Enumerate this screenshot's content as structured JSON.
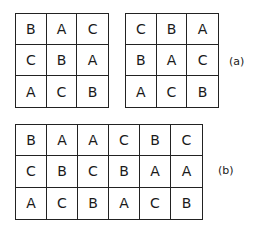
{
  "figure_a": {
    "label": "(a)",
    "left_square": [
      [
        "B",
        "A",
        "C"
      ],
      [
        "C",
        "B",
        "A"
      ],
      [
        "A",
        "C",
        "B"
      ]
    ],
    "right_square": [
      [
        "C",
        "B",
        "A"
      ],
      [
        "B",
        "A",
        "C"
      ],
      [
        "A",
        "C",
        "B"
      ]
    ]
  },
  "figure_b": {
    "label": "(b)",
    "rectangle": [
      [
        "B",
        "A",
        "A",
        "C",
        "B",
        "C"
      ],
      [
        "C",
        "B",
        "C",
        "B",
        "A",
        "A"
      ],
      [
        "A",
        "C",
        "B",
        "A",
        "C",
        "B"
      ]
    ]
  }
}
